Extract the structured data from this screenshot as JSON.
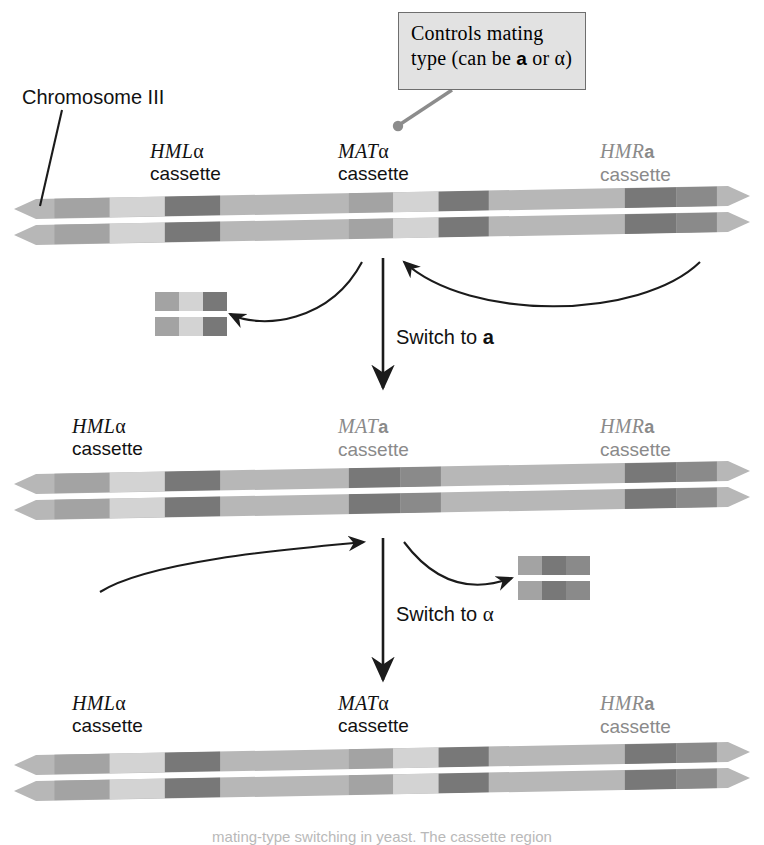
{
  "figure": {
    "chromosome_label": "Chromosome III",
    "bottom_caption": "mating-type switching in yeast. The cassette region"
  },
  "callout": {
    "line1": "Controls mating",
    "line2_pre": "type (can be ",
    "line2_a": "a",
    "line2_post": " or α)"
  },
  "rows": [
    {
      "id": "row-1",
      "state": "MAT alpha",
      "labels": [
        {
          "gene": "HML",
          "suffix": "α",
          "suffix_bold": false,
          "cassette": "cassette",
          "tone": "dark"
        },
        {
          "gene": "MAT",
          "suffix": "α",
          "suffix_bold": false,
          "cassette": "cassette",
          "tone": "dark"
        },
        {
          "gene": "HMR",
          "suffix": "a",
          "suffix_bold": true,
          "cassette": "cassette",
          "tone": "dim"
        }
      ]
    },
    {
      "id": "row-2",
      "state": "MAT a",
      "labels": [
        {
          "gene": "HML",
          "suffix": "α",
          "suffix_bold": false,
          "cassette": "cassette",
          "tone": "dark"
        },
        {
          "gene": "MAT",
          "suffix": "a",
          "suffix_bold": true,
          "cassette": "cassette",
          "tone": "dim"
        },
        {
          "gene": "HMR",
          "suffix": "a",
          "suffix_bold": true,
          "cassette": "cassette",
          "tone": "dim"
        }
      ]
    },
    {
      "id": "row-3",
      "state": "MAT alpha",
      "labels": [
        {
          "gene": "HML",
          "suffix": "α",
          "suffix_bold": false,
          "cassette": "cassette",
          "tone": "dark"
        },
        {
          "gene": "MAT",
          "suffix": "α",
          "suffix_bold": false,
          "cassette": "cassette",
          "tone": "dark"
        },
        {
          "gene": "HMR",
          "suffix": "a",
          "suffix_bold": true,
          "cassette": "cassette",
          "tone": "dim"
        }
      ]
    }
  ],
  "switches": [
    {
      "id": "switch-1",
      "pre": "Switch to ",
      "mark": "a",
      "bold": true
    },
    {
      "id": "switch-2",
      "pre": "Switch to ",
      "mark": "α",
      "bold": false
    }
  ],
  "colors": {
    "backbone": "#b7b7b7",
    "band_light": "#d3d3d3",
    "band_mid": "#a3a3a3",
    "band_dark": "#8a8a8a",
    "band_darker": "#787878",
    "callout_fill": "#e2e2e2",
    "callout_border": "#6e6e6e",
    "leader": "#8c8c8c",
    "arrow": "#1b1b1b",
    "dim_text": "#8a8a8a",
    "dark_text": "#111111"
  },
  "chromosome_bands": {
    "row1": [
      {
        "x": 0.055,
        "w": 0.075,
        "tone": "band_mid"
      },
      {
        "x": 0.13,
        "w": 0.075,
        "tone": "band_light"
      },
      {
        "x": 0.205,
        "w": 0.075,
        "tone": "band_darker"
      },
      {
        "x": 0.455,
        "w": 0.06,
        "tone": "band_mid"
      },
      {
        "x": 0.515,
        "w": 0.062,
        "tone": "band_light"
      },
      {
        "x": 0.577,
        "w": 0.068,
        "tone": "band_darker"
      },
      {
        "x": 0.83,
        "w": 0.07,
        "tone": "band_darker"
      },
      {
        "x": 0.9,
        "w": 0.055,
        "tone": "band_dark"
      }
    ],
    "row2": [
      {
        "x": 0.055,
        "w": 0.075,
        "tone": "band_mid"
      },
      {
        "x": 0.13,
        "w": 0.075,
        "tone": "band_light"
      },
      {
        "x": 0.205,
        "w": 0.075,
        "tone": "band_darker"
      },
      {
        "x": 0.455,
        "w": 0.07,
        "tone": "band_darker"
      },
      {
        "x": 0.525,
        "w": 0.055,
        "tone": "band_dark"
      },
      {
        "x": 0.83,
        "w": 0.07,
        "tone": "band_darker"
      },
      {
        "x": 0.9,
        "w": 0.055,
        "tone": "band_dark"
      }
    ],
    "row3": [
      {
        "x": 0.055,
        "w": 0.075,
        "tone": "band_mid"
      },
      {
        "x": 0.13,
        "w": 0.075,
        "tone": "band_light"
      },
      {
        "x": 0.205,
        "w": 0.075,
        "tone": "band_darker"
      },
      {
        "x": 0.455,
        "w": 0.06,
        "tone": "band_mid"
      },
      {
        "x": 0.515,
        "w": 0.062,
        "tone": "band_light"
      },
      {
        "x": 0.577,
        "w": 0.068,
        "tone": "band_darker"
      },
      {
        "x": 0.83,
        "w": 0.07,
        "tone": "band_darker"
      },
      {
        "x": 0.9,
        "w": 0.055,
        "tone": "band_dark"
      }
    ]
  },
  "fragments": [
    {
      "id": "fragment-alpha-excised",
      "blocks": [
        "band_mid",
        "band_light",
        "band_darker"
      ]
    },
    {
      "id": "fragment-a-excised",
      "blocks": [
        "band_mid",
        "band_darker",
        "band_dark"
      ]
    }
  ]
}
